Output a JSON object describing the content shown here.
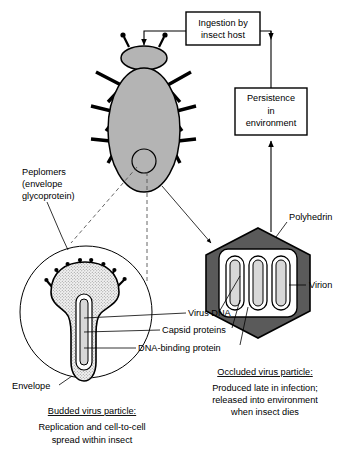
{
  "figure": {
    "colors": {
      "insect_body": "#b4b4b4",
      "polyhedron": "#5a5a5a",
      "virion_core": "#d8d8d8",
      "occlusion_matrix_outline": "#000000",
      "stipple": "#e8e8e8",
      "line": "#000000",
      "dashed_line": "#555555",
      "background": "#ffffff"
    }
  },
  "flow_boxes": [
    {
      "id": "ingestion",
      "lines": [
        "Ingestion by",
        "insect host"
      ]
    },
    {
      "id": "persistence",
      "lines": [
        "Persistence",
        "in",
        "environment"
      ]
    }
  ],
  "callouts": [
    {
      "id": "peplomers",
      "lines": [
        "Peplomers",
        "(envelope",
        "glycoprotein)"
      ]
    },
    {
      "id": "polyhedrin",
      "lines": [
        "Polyhedrin"
      ]
    },
    {
      "id": "virion",
      "lines": [
        "Virion"
      ]
    },
    {
      "id": "virus-dna",
      "lines": [
        "Virus DNA"
      ]
    },
    {
      "id": "capsid",
      "lines": [
        "Capsid proteins"
      ]
    },
    {
      "id": "dna-binding",
      "lines": [
        "DNA-binding protein"
      ]
    },
    {
      "id": "envelope",
      "lines": [
        "Envelope"
      ]
    }
  ],
  "captions": [
    {
      "id": "budded",
      "heading": "Budded virus particle:",
      "lines": [
        "Replication and cell-to-cell",
        "spread within insect"
      ]
    },
    {
      "id": "occluded",
      "heading": "Occluded virus particle:",
      "lines": [
        "Produced late in infection;",
        "released into environment",
        "when insect dies"
      ]
    }
  ],
  "structures": {
    "insect": {
      "name": "insect-host",
      "legs_per_side": 3,
      "antennae": 2
    },
    "budded_particle": {
      "name": "budded-virus-particle",
      "peplomer_spikes": 9
    },
    "occluded_particle": {
      "name": "occluded-virus-particle",
      "virion_count": 3
    }
  }
}
